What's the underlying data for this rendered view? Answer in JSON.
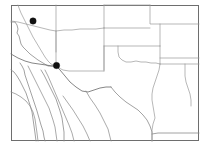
{
  "figure": {
    "kind": "locality-map",
    "width": 212,
    "height": 153,
    "background_color": "#ffffff"
  },
  "frame": {
    "name": "map-frame",
    "x": 11,
    "y": 5,
    "width": 188,
    "height": 136,
    "stroke_color": "#6e6e6e",
    "stroke_width": 1,
    "fill_color": "#ffffff"
  },
  "styles": {
    "coastline_color": "#8a8a8a",
    "state_border_color": "#9a9a9a",
    "international_border_color": "#707070",
    "mexico_internal_color": "#8d8d8d",
    "marker_color": "#111111"
  },
  "markers": [
    {
      "name": "locality-marker-1",
      "label": "northern Arizona locality",
      "cx": 33,
      "cy": 21,
      "r": 3.2,
      "color": "#111111"
    },
    {
      "name": "locality-marker-2",
      "label": "southeastern Arizona locality",
      "cx": 56.5,
      "cy": 65.5,
      "r": 3.2,
      "color": "#111111"
    }
  ],
  "geography": {
    "coastline_paths": [
      {
        "name": "pacific-coast-california",
        "d": "M 11 22 L 15 22 L 17 25 L 18 29 L 17 33 L 19 36 L 20 40 L 21 44 L 23 47 L 26 50 L 30 54 L 34 57 L 38 60 L 43 63 L 48 66 L 53 66 L 56 66"
      },
      {
        "name": "baja-california-peninsula",
        "d": "M 20 63 L 22 66 L 24 70 L 25 75 L 27 81 L 29 87 L 31 93 L 33 99 L 35 105 L 37 111 L 39 118 L 41 125 L 43 131 L 44 137 L 45 141"
      },
      {
        "name": "baja-california-gulf-side",
        "d": "M 11 70 L 14 72 L 17 76 L 20 81 L 23 87 L 26 93 L 28 99 L 30 105 L 32 112 L 33 119 L 34 126 L 35 133 L 36 141"
      },
      {
        "name": "gulf-of-california-mainland",
        "d": "M 41 70 L 44 75 L 47 81 L 50 87 L 53 93 L 56 99 L 58 105 L 60 111 L 62 118 L 63 125 L 64 132 L 64 141"
      },
      {
        "name": "gulf-of-mexico-coast-texas",
        "d": "M 111 87 L 115 92 L 120 97 L 126 102 L 132 106 L 138 110 L 143 115 L 147 120 L 150 126 L 152 132 L 152 137 L 152 141"
      },
      {
        "name": "gulf-coast-louisiana",
        "d": "M 152 134 L 158 133 L 164 133 L 170 133 L 176 133 L 182 133 L 189 133 L 195 133 L 199 133"
      }
    ],
    "state_border_paths": [
      {
        "name": "california-nevada-border",
        "d": "M 18 5 L 19 8 L 21 13 L 24 19 L 27 25 L 30 31 L 33 37 L 36 42 L 39 47 L 42 52 L 45 57 L 48 61 L 51 64 L 56 66"
      },
      {
        "name": "nevada-utah-border",
        "d": "M 56 5 L 56 13 L 56 21 L 56 29 L 56 37 L 56 45 L 56 52"
      },
      {
        "name": "nevada-arizona-diagonal",
        "d": "M 11 21 L 18 22 L 26 24 L 34 26 L 42 28 L 50 30 L 56 31"
      },
      {
        "name": "utah-arizona-border",
        "d": "M 56 31 L 64 30 L 72 30 L 80 29 L 88 29 L 96 29 L 104 28"
      },
      {
        "name": "arizona-newmexico-border",
        "d": "M 56 31 L 56 39 L 56 47 L 56 55 L 56 62 L 56 66"
      },
      {
        "name": "utah-colorado-border",
        "d": "M 104 5 L 104 12 L 104 19 L 104 28"
      },
      {
        "name": "newmexico-colorado-border",
        "d": "M 104 28 L 104 36 L 104 44 L 104 52 L 104 60 L 104 68 L 104 71"
      },
      {
        "name": "newmexico-texas-border",
        "d": "M 104 71 L 97 71 L 90 71 L 83 71 L 76 71 L 69 71 L 63 70 L 59 68 L 56 66"
      },
      {
        "name": "colorado-kansas-border",
        "d": "M 104 28 L 112 28 L 120 28 L 128 28 L 136 28 L 144 28 L 150 28"
      },
      {
        "name": "colorado-northern-border",
        "d": "M 104 5 L 112 5 L 120 5 L 128 5 L 136 5 L 144 5 L 150 5"
      },
      {
        "name": "kansas-nebraska-border",
        "d": "M 150 5 L 150 12 L 150 19 L 150 24 L 158 24 L 166 24 L 174 24 L 182 24 L 190 24 L 199 24"
      },
      {
        "name": "kansas-oklahoma-border",
        "d": "M 104 46 L 112 46 L 120 46 L 128 46 L 136 46 L 144 46 L 152 46 L 160 46"
      },
      {
        "name": "texas-panhandle-east",
        "d": "M 104 46 L 104 54 L 104 62 L 104 70"
      },
      {
        "name": "oklahoma-texas-red-river",
        "d": "M 118 46 L 118 52 L 119 57 L 122 60 L 126 62 L 131 62 L 136 61 L 141 62 L 146 62 L 151 63 L 156 63 L 160 64"
      },
      {
        "name": "oklahoma-missouri-arkansas-border",
        "d": "M 160 46 L 160 52 L 160 58 L 160 64"
      },
      {
        "name": "kansas-missouri-border",
        "d": "M 160 24 L 160 31 L 160 38 L 160 46"
      },
      {
        "name": "missouri-arkansas-border",
        "d": "M 160 58 L 168 58 L 176 58 L 184 58 L 192 58 L 199 58"
      },
      {
        "name": "texas-louisiana-border",
        "d": "M 160 64 L 159 70 L 157 76 L 155 82 L 153 88 L 152 94 L 152 100 L 153 106 L 154 112 L 155 118 L 153 124 L 152 130 L 152 137 L 152 141"
      },
      {
        "name": "arkansas-louisiana-border",
        "d": "M 160 64 L 168 64 L 176 64 L 184 64 L 192 64 L 199 64"
      },
      {
        "name": "louisiana-east-edge",
        "d": "M 185 64 L 185 70 L 185 76 L 186 82 L 188 88 L 190 94 L 191 100 L 191 106"
      }
    ],
    "international_border_paths": [
      {
        "name": "us-mexico-border-arizona",
        "d": "M 11 54 L 18 58 L 25 61 L 32 63 L 39 64 L 46 65 L 52 66 L 56 66"
      },
      {
        "name": "us-mexico-border-newmexico-texas",
        "d": "M 56 66 L 60 70 L 65 76 L 70 82 L 76 87 L 82 91 L 88 92 L 94 90 L 100 88 L 106 87 L 111 87"
      }
    ],
    "mexico_internal_paths": [
      {
        "name": "sonora-sinaloa-line",
        "d": "M 28 66 L 31 72 L 34 78 L 37 84 L 40 90 L 43 96 L 46 102 L 49 108 L 51 114 L 53 120 L 55 127 L 56 134 L 57 141"
      },
      {
        "name": "chihuahua-west-line",
        "d": "M 45 70 L 48 76 L 51 83 L 54 90 L 57 97 L 60 104 L 63 111 L 66 118 L 69 125 L 72 133 L 74 141"
      },
      {
        "name": "baja-sur-division",
        "d": "M 11 92 L 16 94 L 21 97 L 26 101 L 30 106 L 33 112 L 35 119 L 36 126 L 37 133 L 38 141"
      },
      {
        "name": "durango-line",
        "d": "M 63 96 L 68 103 L 73 110 L 78 118 L 83 126 L 87 134 L 90 141"
      },
      {
        "name": "coahuila-line",
        "d": "M 86 91 L 90 98 L 95 105 L 100 113 L 104 121 L 108 129 L 110 137 L 111 141"
      }
    ]
  }
}
